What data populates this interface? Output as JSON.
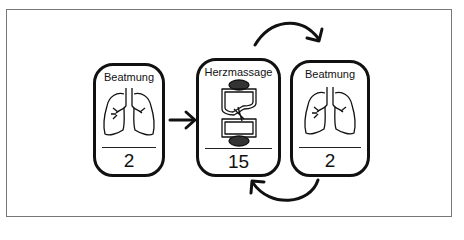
{
  "diagram": {
    "type": "cpr-sequence",
    "steps": [
      {
        "title": "Beatmung",
        "icon": "lungs-icon",
        "count": "2"
      },
      {
        "title": "Herzmassage",
        "icon": "heart-compression-icon",
        "count": "15"
      },
      {
        "title": "Beatmung",
        "icon": "lungs-icon",
        "count": "2"
      }
    ],
    "connectors": [
      {
        "from": 0,
        "to": 1,
        "style": "straight-arrow"
      },
      {
        "from": 1,
        "to": 2,
        "style": "curved-arrow-top"
      },
      {
        "from": 2,
        "to": 1,
        "style": "curved-arrow-bottom"
      }
    ],
    "colors": {
      "stroke": "#111111",
      "frame": "#777777",
      "background": "#ffffff"
    }
  }
}
